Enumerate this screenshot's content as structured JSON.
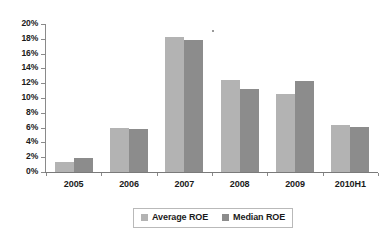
{
  "chart_data": {
    "type": "bar",
    "title": "",
    "subtitle": "",
    "xlabel": "",
    "ylabel": "",
    "categories": [
      "2005",
      "2006",
      "2007",
      "2008",
      "2009",
      "2010H1"
    ],
    "series": [
      {
        "name": "Average ROE",
        "color": "#b3b3b3",
        "values": [
          1.4,
          5.9,
          18.2,
          12.4,
          10.5,
          6.4
        ]
      },
      {
        "name": "Median ROE",
        "color": "#8c8c8c",
        "values": [
          1.9,
          5.8,
          17.9,
          11.2,
          12.3,
          6.1
        ]
      }
    ],
    "ylim": [
      0,
      20
    ],
    "ytick_values": [
      0,
      2,
      4,
      6,
      8,
      10,
      12,
      14,
      16,
      18,
      20
    ],
    "ytick_labels": [
      "0%",
      "2%",
      "4%",
      "6%",
      "8%",
      "10%",
      "12%",
      "14%",
      "16%",
      "18%",
      "20%"
    ],
    "value_unit": "%",
    "grid": false,
    "legend_position": "bottom",
    "legend_entries": [
      "Average ROE",
      "Median ROE"
    ]
  }
}
